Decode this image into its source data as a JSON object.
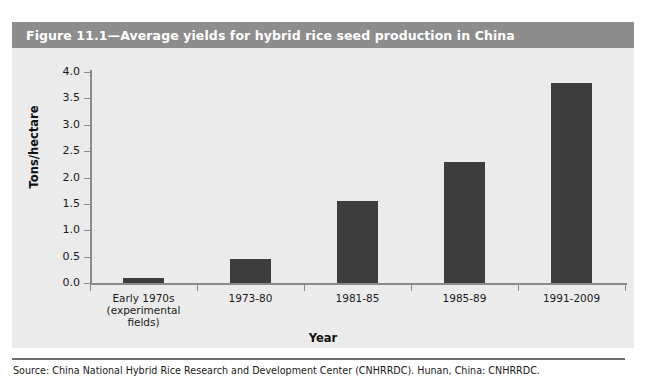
{
  "figure": {
    "title": "Figure 11.1—Average yields for hybrid rice seed production in China",
    "source": "Source: China National Hybrid Rice Research and Development Center (CNHRRDC). Hunan, China: CNHRRDC.",
    "colors": {
      "title_bar": "#8d8d8d",
      "title_text": "#ffffff",
      "panel_background": "#ebebeb",
      "bar": "#3d3d3d",
      "axis": "#8a8a8a",
      "page_background": "#ffffff"
    }
  },
  "chart_data": {
    "type": "bar",
    "title": "Figure 11.1—Average yields for hybrid rice seed production in China",
    "xlabel": "Year",
    "ylabel": "Tons/hectare",
    "categories": [
      "Early 1970s (experimental fields)",
      "1973-80",
      "1981-85",
      "1985-89",
      "1991-2009"
    ],
    "category_lines": [
      [
        "Early 1970s",
        "(experimental",
        "fields)"
      ],
      [
        "1973-80"
      ],
      [
        "1981-85"
      ],
      [
        "1985-89"
      ],
      [
        "1991-2009"
      ]
    ],
    "values": [
      0.1,
      0.45,
      1.55,
      2.3,
      3.8
    ],
    "ylim": [
      0.0,
      4.0
    ],
    "ytick_labels": [
      "0.0",
      "0.5",
      "1.0",
      "1.5",
      "2.0",
      "2.5",
      "3.0",
      "3.5",
      "4.0"
    ],
    "ytick_values": [
      0.0,
      0.5,
      1.0,
      1.5,
      2.0,
      2.5,
      3.0,
      3.5,
      4.0
    ],
    "grid": false,
    "legend": null
  }
}
